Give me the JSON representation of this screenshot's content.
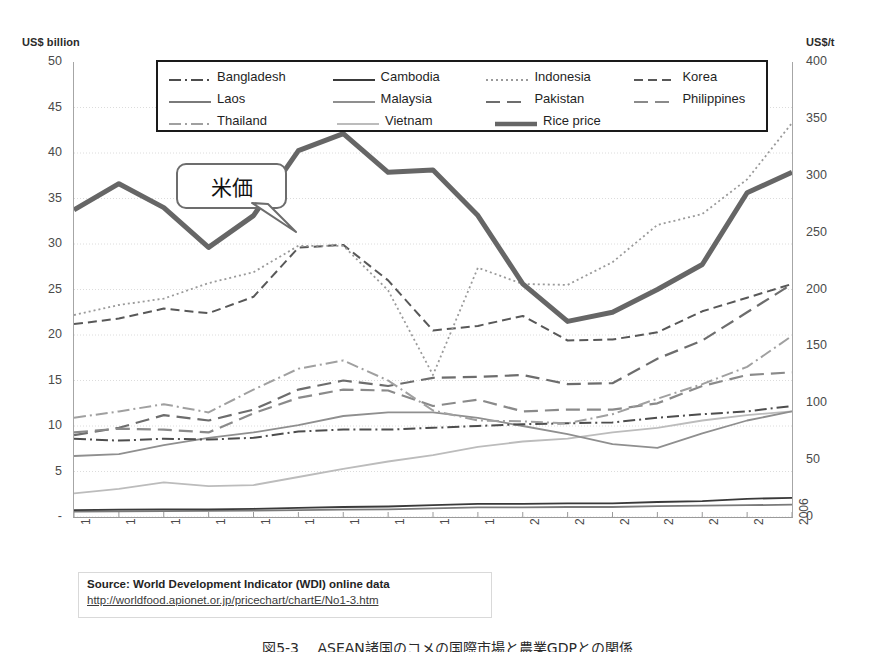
{
  "axes": {
    "left_title": "US$ billion",
    "right_title": "US$/t",
    "left_ticks": [
      "50",
      "45",
      "40",
      "35",
      "30",
      "25",
      "20",
      "15",
      "10",
      "5",
      "-"
    ],
    "right_ticks": [
      "400",
      "350",
      "300",
      "250",
      "200",
      "150",
      "100",
      "50",
      "0"
    ],
    "x_ticks": [
      "1990",
      "1991",
      "1992",
      "1993",
      "1994",
      "1995",
      "1996",
      "1997",
      "1998",
      "1999",
      "2000",
      "2001",
      "2002",
      "2003",
      "2004",
      "2005",
      "2006"
    ]
  },
  "legend": {
    "rows": [
      [
        {
          "label": "Bangladesh",
          "style": "dash-dot",
          "color": "#4d4d4d"
        },
        {
          "label": "Cambodia",
          "style": "solid",
          "color": "#3a3a3a"
        },
        {
          "label": "Indonesia",
          "style": "dotted",
          "color": "#9a9a9a"
        },
        {
          "label": "Korea",
          "style": "dashed",
          "color": "#585858"
        }
      ],
      [
        {
          "label": "Laos",
          "style": "solid",
          "color": "#7a7a7a"
        },
        {
          "label": "Malaysia",
          "style": "solid",
          "color": "#8f8f8f"
        },
        {
          "label": "Pakistan",
          "style": "dashed-long",
          "color": "#6d6d6d"
        },
        {
          "label": "Philippines",
          "style": "dashed-long",
          "color": "#8a8a8a"
        }
      ],
      [
        {
          "label": "Thailand",
          "style": "dash-dot",
          "color": "#a0a0a0"
        },
        {
          "label": "Vietnam",
          "style": "solid",
          "color": "#bcbcbc"
        },
        {
          "label": "Rice price",
          "style": "thick",
          "color": "#666666"
        }
      ]
    ]
  },
  "callout": {
    "text": "米価"
  },
  "source": {
    "line": "Source: World Development Indicator (WDI) online data",
    "url": "http://worldfood.apionet.or.jp/pricechart/chartE/No1-3.htm"
  },
  "caption": {
    "text": "図5-3 　ASEAN諸国のコメの国際市場と農業GDPとの関係"
  },
  "chart_data": {
    "type": "line",
    "title": "",
    "xlabel": "",
    "ylabel": "US$ billion",
    "y2label": "US$/t",
    "x": [
      1990,
      1991,
      1992,
      1993,
      1994,
      1995,
      1996,
      1997,
      1998,
      1999,
      2000,
      2001,
      2002,
      2003,
      2004,
      2005,
      2006
    ],
    "ylim": [
      0,
      50
    ],
    "y2lim": [
      0,
      400
    ],
    "grid": true,
    "legend_position": "top-center",
    "annotations": [
      {
        "text": "米価",
        "points_to": "Rice price series near 1994"
      }
    ],
    "series": [
      {
        "name": "Rice price",
        "axis": "right",
        "style": "thick",
        "color": "#666666",
        "unit": "US$/t",
        "values": [
          270,
          293,
          272,
          237,
          265,
          322,
          337,
          303,
          305,
          265,
          205,
          172,
          180,
          200,
          222,
          285,
          303
        ]
      },
      {
        "name": "Indonesia",
        "axis": "left",
        "style": "dotted",
        "color": "#9a9a9a",
        "unit": "US$ billion",
        "values": [
          22.2,
          23.3,
          24.0,
          25.7,
          26.9,
          29.8,
          29.8,
          24.9,
          15.6,
          27.4,
          25.6,
          25.5,
          28.0,
          32.1,
          33.3,
          37.1,
          43.3
        ]
      },
      {
        "name": "Korea",
        "axis": "left",
        "style": "dashed",
        "color": "#585858",
        "unit": "US$ billion",
        "values": [
          21.2,
          21.8,
          22.9,
          22.4,
          24.2,
          29.6,
          29.9,
          26.0,
          20.5,
          21.0,
          22.1,
          19.4,
          19.5,
          20.3,
          22.6,
          24.1,
          25.6
        ]
      },
      {
        "name": "Thailand",
        "axis": "left",
        "style": "dash-dot",
        "color": "#a0a0a0",
        "unit": "US$ billion",
        "values": [
          10.9,
          11.6,
          12.4,
          11.5,
          14.0,
          16.3,
          17.2,
          15.0,
          11.7,
          10.6,
          10.5,
          10.3,
          11.3,
          13.0,
          14.6,
          16.5,
          19.9
        ]
      },
      {
        "name": "Philippines",
        "axis": "left",
        "style": "dashed-long",
        "color": "#8a8a8a",
        "unit": "US$ billion",
        "values": [
          9.3,
          9.7,
          9.6,
          9.3,
          11.4,
          13.1,
          14.0,
          13.9,
          12.2,
          12.9,
          11.6,
          11.8,
          11.8,
          12.5,
          14.4,
          15.6,
          15.9
        ]
      },
      {
        "name": "Pakistan",
        "axis": "left",
        "style": "dashed-long",
        "color": "#6d6d6d",
        "unit": "US$ billion",
        "values": [
          9.0,
          9.8,
          11.2,
          10.6,
          11.8,
          14.0,
          15.0,
          14.4,
          15.3,
          15.4,
          15.6,
          14.6,
          14.7,
          17.4,
          19.4,
          22.5,
          25.6
        ]
      },
      {
        "name": "Bangladesh",
        "axis": "left",
        "style": "dash-dot",
        "color": "#4d4d4d",
        "unit": "US$ billion",
        "values": [
          8.6,
          8.4,
          8.6,
          8.5,
          8.7,
          9.4,
          9.6,
          9.6,
          9.8,
          10.0,
          10.2,
          10.3,
          10.4,
          10.9,
          11.3,
          11.6,
          12.2
        ]
      },
      {
        "name": "Malaysia",
        "axis": "left",
        "style": "solid",
        "color": "#8f8f8f",
        "unit": "US$ billion",
        "values": [
          6.7,
          6.9,
          7.9,
          8.7,
          9.3,
          10.1,
          11.1,
          11.5,
          11.5,
          10.9,
          10.0,
          9.1,
          8.0,
          7.6,
          9.2,
          10.6,
          11.6
        ]
      },
      {
        "name": "Vietnam",
        "axis": "left",
        "style": "solid",
        "color": "#bcbcbc",
        "unit": "US$ billion",
        "values": [
          2.6,
          3.1,
          3.8,
          3.4,
          3.5,
          4.4,
          5.3,
          6.1,
          6.8,
          7.7,
          8.3,
          8.6,
          9.3,
          9.8,
          10.6,
          11.2,
          11.6
        ]
      },
      {
        "name": "Cambodia",
        "axis": "left",
        "style": "solid",
        "color": "#3a3a3a",
        "unit": "US$ billion",
        "values": [
          0.75,
          0.8,
          0.85,
          0.85,
          0.9,
          1.0,
          1.1,
          1.15,
          1.3,
          1.45,
          1.45,
          1.5,
          1.5,
          1.65,
          1.75,
          2.0,
          2.1
        ]
      },
      {
        "name": "Laos",
        "axis": "left",
        "style": "solid",
        "color": "#7a7a7a",
        "unit": "US$ billion",
        "values": [
          0.6,
          0.62,
          0.65,
          0.67,
          0.7,
          0.75,
          0.8,
          0.85,
          0.95,
          1.05,
          1.05,
          1.1,
          1.1,
          1.2,
          1.25,
          1.3,
          1.35
        ]
      }
    ]
  }
}
